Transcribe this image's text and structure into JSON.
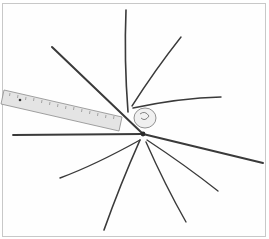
{
  "image": {
    "description": "Grayscale photograph of a cluster of long pine-needle-like stalks radiating from a central bound point, with a metal ruler laid across for scale",
    "background_color": "#ffffff",
    "border_color": "#c8c8c8",
    "stalk_color": "#3a3a3a",
    "ruler_color": "#d9d9d9",
    "center": [
      143,
      134
    ],
    "stalks": [
      {
        "tip": [
          126,
          10
        ]
      },
      {
        "tip": [
          181,
          37
        ]
      },
      {
        "tip": [
          52,
          47
        ]
      },
      {
        "tip": [
          221,
          97
        ]
      },
      {
        "tip": [
          13,
          135
        ]
      },
      {
        "tip": [
          263,
          163
        ]
      },
      {
        "tip": [
          60,
          178
        ]
      },
      {
        "tip": [
          218,
          191
        ]
      },
      {
        "tip": [
          104,
          230
        ]
      },
      {
        "tip": [
          186,
          222
        ]
      }
    ],
    "ruler": {
      "corners": [
        [
          4,
          90
        ],
        [
          122,
          117
        ],
        [
          119,
          131
        ],
        [
          1,
          104
        ]
      ]
    }
  }
}
